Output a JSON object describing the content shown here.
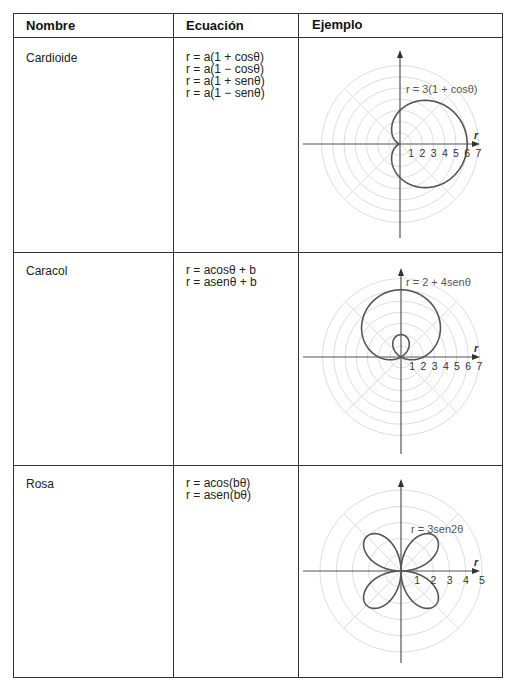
{
  "table": {
    "headers": [
      "Nombre",
      "Ecuación",
      "Ejemplo"
    ],
    "rows": [
      {
        "name": "Cardioide",
        "equations": [
          "r = a(1 + cosθ)",
          "r = a(1 − cosθ)",
          "r = a(1 + senθ)",
          "r = a(1 − senθ)"
        ],
        "example": {
          "caption": "r = 3(1 + cosθ)",
          "axis_label": "r",
          "ticks": [
            "1",
            "2",
            "3",
            "4",
            "5",
            "6",
            "7"
          ]
        }
      },
      {
        "name": "Caracol",
        "equations": [
          "r = acosθ + b",
          "r = asenθ + b"
        ],
        "example": {
          "caption": "r = 2 + 4senθ",
          "axis_label": "r",
          "ticks": [
            "1",
            "2",
            "3",
            "4",
            "5",
            "6",
            "7"
          ]
        }
      },
      {
        "name": "Rosa",
        "equations": [
          "r = acos(bθ)",
          "r = asen(bθ)"
        ],
        "example": {
          "caption": "r = 3sen2θ",
          "axis_label": "r",
          "ticks": [
            "1",
            "2",
            "3",
            "4",
            "5"
          ]
        }
      }
    ]
  },
  "colors": {
    "border": "#333333",
    "curve": "#555555",
    "grid": "#dddddd",
    "axis": "#555555"
  }
}
